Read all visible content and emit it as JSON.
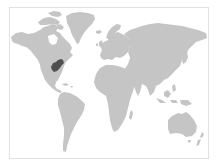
{
  "map": {
    "title": "World map",
    "projection": "Miller-like",
    "colors": {
      "background": "#ffffff",
      "border": "#e2e2e2",
      "land": "#c5c5c5",
      "highlight": "#4f4f4f"
    },
    "regions": [
      {
        "name": "North America",
        "highlighted": false
      },
      {
        "name": "Greenland",
        "highlighted": false
      },
      {
        "name": "South America",
        "highlighted": false
      },
      {
        "name": "Europe",
        "highlighted": false
      },
      {
        "name": "Africa",
        "highlighted": false
      },
      {
        "name": "Asia",
        "highlighted": false
      },
      {
        "name": "Australia",
        "highlighted": false
      },
      {
        "name": "Eastern United States (Ohio Valley region)",
        "highlighted": true
      }
    ],
    "highlighted_region": "Eastern United States (Ohio Valley region)"
  }
}
